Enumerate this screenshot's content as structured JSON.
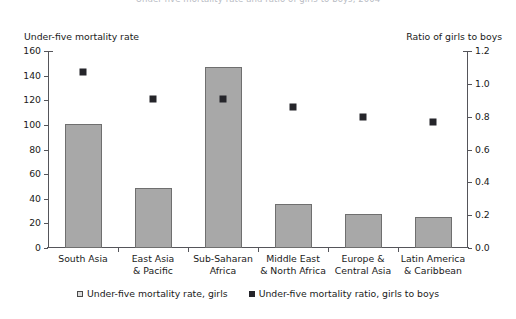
{
  "figure": {
    "title_clipped": "Under-five mortality rate and ratio of girls to boys, 2004"
  },
  "axes": {
    "left_caption": "Under-five mortality rate",
    "right_caption": "Ratio of girls to boys",
    "left_ticks": [
      "160",
      "140",
      "120",
      "100",
      "80",
      "60",
      "40",
      "20",
      "0"
    ],
    "right_ticks": [
      "1.2",
      "1.0",
      "0.8",
      "0.6",
      "0.4",
      "0.2",
      "0.0"
    ]
  },
  "legend": {
    "items": [
      {
        "label": "Under-five mortality rate, girls",
        "marker": "bar-swatch",
        "color": "#a8a8a8"
      },
      {
        "label": "Under-five mortality ratio, girls to boys",
        "marker": "square-marker",
        "color": "#25252a"
      }
    ]
  },
  "chart_data": {
    "type": "bar",
    "title": "Under-five mortality rate and ratio of girls to boys, 2004",
    "xlabel": "",
    "ylabel": "Under-five mortality rate",
    "y2label": "Ratio of girls to boys",
    "ylim": [
      0,
      160
    ],
    "y2lim": [
      0.0,
      1.2
    ],
    "yticks": [
      0,
      20,
      40,
      60,
      80,
      100,
      120,
      140,
      160
    ],
    "y2ticks": [
      0.0,
      0.2,
      0.4,
      0.6,
      0.8,
      1.0,
      1.2
    ],
    "grid": false,
    "legend_position": "bottom",
    "categories": [
      "South Asia",
      "East Asia & Pacific",
      "Sub-Saharan Africa",
      "Middle East & North Africa",
      "Europe & Central Asia",
      "Latin America & Caribbean"
    ],
    "category_lines": [
      [
        "South Asia",
        ""
      ],
      [
        "East Asia",
        "& Pacific"
      ],
      [
        "Sub-Saharan",
        "Africa"
      ],
      [
        "Middle East",
        "& North Africa"
      ],
      [
        "Europe &",
        "Central Asia"
      ],
      [
        "Latin America",
        "& Caribbean"
      ]
    ],
    "series": [
      {
        "name": "Under-five mortality rate, girls",
        "type": "bar",
        "axis": "left",
        "color": "#a8a8a8",
        "values": [
          101,
          49,
          147,
          36,
          28,
          25
        ]
      },
      {
        "name": "Under-five mortality ratio, girls to boys",
        "type": "scatter",
        "axis": "right",
        "color": "#25252a",
        "values": [
          1.07,
          0.91,
          0.91,
          0.86,
          0.8,
          0.77
        ]
      }
    ]
  }
}
